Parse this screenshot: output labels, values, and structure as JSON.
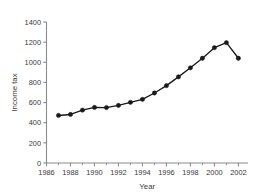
{
  "chart_data": {
    "type": "line",
    "title": "",
    "xlabel": "Year",
    "ylabel": "Income tax",
    "x": [
      1987,
      1988,
      1989,
      1990,
      1991,
      1992,
      1993,
      1994,
      1995,
      1996,
      1997,
      1998,
      1999,
      2000,
      2001,
      2002
    ],
    "values": [
      472,
      482,
      525,
      552,
      550,
      572,
      602,
      632,
      695,
      768,
      855,
      945,
      1040,
      1145,
      1195,
      1040
    ],
    "series": [
      {
        "name": "Income tax",
        "values": [
          472,
          482,
          525,
          552,
          550,
          572,
          602,
          632,
          695,
          768,
          855,
          945,
          1040,
          1145,
          1195,
          1040
        ]
      }
    ],
    "xlim": [
      1986,
      2002.8
    ],
    "ylim": [
      0,
      1400
    ],
    "xticks": [
      1986,
      1988,
      1990,
      1992,
      1994,
      1996,
      1998,
      2000,
      2002
    ],
    "xticklabels": [
      "1986",
      "1988",
      "1990",
      "1992",
      "1994",
      "1996",
      "1998",
      "2000",
      "2002"
    ],
    "xminorticks": [
      1987,
      1989,
      1991,
      1993,
      1995,
      1997,
      1999,
      2001
    ],
    "yticks": [
      0,
      200,
      400,
      600,
      800,
      1000,
      1200,
      1400
    ],
    "yticklabels": [
      "0",
      "200",
      "400",
      "600",
      "800",
      "1000",
      "1200",
      "1400"
    ],
    "grid": false,
    "legend": false,
    "marker": "circle",
    "line_color": "#1a1a1a",
    "marker_color": "#1a1a1a",
    "axis_color": "#8a8a8a",
    "background_color": "#ffffff"
  }
}
